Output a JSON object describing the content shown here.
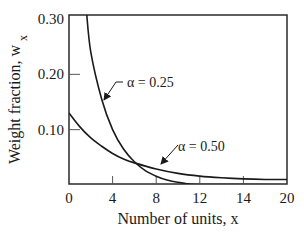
{
  "chart_data": {
    "type": "line",
    "title": "",
    "xlabel": "Number of units, x",
    "ylabel": "Weight fraction, w",
    "ylabel_subscript": "x",
    "xlim": [
      0,
      20
    ],
    "ylim": [
      0,
      0.3
    ],
    "grid": false,
    "x_ticks": [
      0,
      4,
      8,
      12,
      16,
      20
    ],
    "x_tick_labels": [
      "0",
      "4",
      "8",
      "12",
      "14",
      "20"
    ],
    "y_ticks": [
      0.1,
      0.2,
      0.3
    ],
    "y_tick_labels": [
      "0.10",
      "0.20",
      "0.30"
    ],
    "series": [
      {
        "name": "α = 0.25",
        "x": [
          1.6,
          2,
          3,
          4,
          5,
          6,
          7,
          8,
          9,
          10,
          11,
          12
        ],
        "y": [
          0.3,
          0.24,
          0.155,
          0.1,
          0.065,
          0.042,
          0.026,
          0.016,
          0.009,
          0.005,
          0.002,
          0.001
        ]
      },
      {
        "name": "α = 0.50",
        "x": [
          0,
          1,
          2,
          3,
          4,
          5,
          6,
          8,
          10,
          12,
          14,
          16,
          18,
          20
        ],
        "y": [
          0.13,
          0.105,
          0.085,
          0.07,
          0.057,
          0.047,
          0.04,
          0.029,
          0.021,
          0.016,
          0.013,
          0.011,
          0.01,
          0.01
        ]
      }
    ],
    "annotations": [
      {
        "text": "α = 0.25",
        "points_to_series": "α = 0.25",
        "at_x": 3.9
      },
      {
        "text": "α = 0.50",
        "points_to_series": "α = 0.50",
        "at_x": 9.2
      }
    ]
  }
}
